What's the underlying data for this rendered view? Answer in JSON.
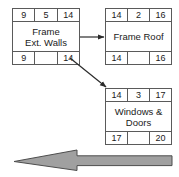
{
  "diagram": {
    "colors": {
      "box_border": "#5a5a5a",
      "box_fill": "#ffffff",
      "text": "#1a1a1a",
      "arrow_fill": "#a0a0a0",
      "arrow_stroke": "#4d4d4d",
      "connector": "#2b2b2b",
      "background": "#ffffff"
    },
    "nodes": [
      {
        "id": "frame-ext-walls",
        "name_line1": "Frame",
        "name_line2": "Ext. Walls",
        "top": {
          "left": "9",
          "mid": "5",
          "right": "14"
        },
        "bottom": {
          "left": "9",
          "mid": "",
          "right": "14"
        }
      },
      {
        "id": "frame-roof",
        "name_line1": "Frame Roof",
        "name_line2": "",
        "top": {
          "left": "14",
          "mid": "2",
          "right": "16"
        },
        "bottom": {
          "left": "14",
          "mid": "",
          "right": "16"
        }
      },
      {
        "id": "windows-doors",
        "name_line1": "Windows &",
        "name_line2": "Doors",
        "top": {
          "left": "14",
          "mid": "3",
          "right": "17"
        },
        "bottom": {
          "left": "17",
          "mid": "",
          "right": "20"
        }
      }
    ],
    "connectors": [
      {
        "id": "walls-to-roof",
        "from": "frame-ext-walls",
        "to": "frame-roof",
        "style": "straight-right"
      },
      {
        "id": "walls-to-windows",
        "from": "frame-ext-walls",
        "to": "windows-doors",
        "style": "diagonal-down-right"
      }
    ],
    "flow_arrow": {
      "id": "time-flow-arrow",
      "direction": "left",
      "label": ""
    }
  }
}
